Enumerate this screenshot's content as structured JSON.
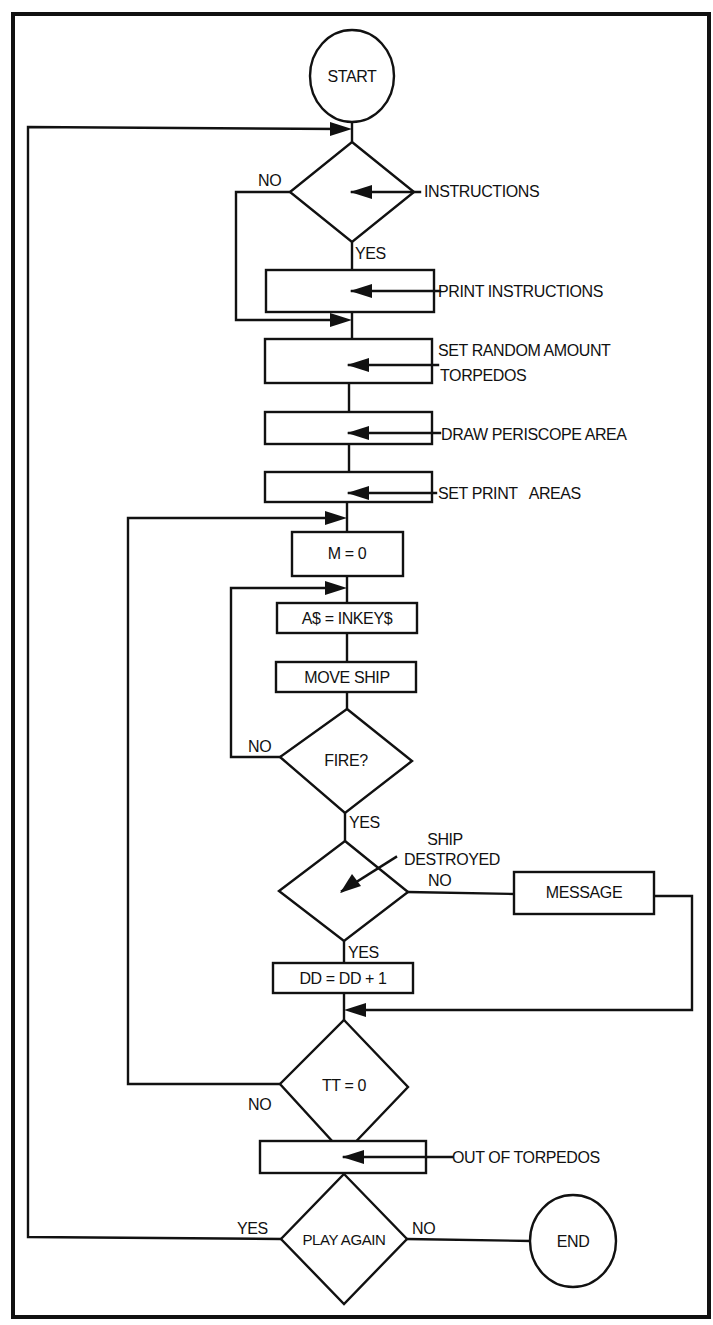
{
  "diagram": {
    "type": "flowchart",
    "colors": {
      "ink": "#111111",
      "paper": "#ffffff"
    }
  },
  "terminals": {
    "start": {
      "label": "START",
      "cx": 352,
      "cy": 76,
      "rx": 42,
      "ry": 46
    },
    "end": {
      "label": "END",
      "cx": 573,
      "cy": 1241,
      "rx": 43,
      "ry": 46
    }
  },
  "decisions": {
    "instructions": {
      "label": "",
      "cx": 352,
      "cy": 192,
      "hw": 62,
      "hh": 50,
      "annotation": "INSTRUCTIONS",
      "no_label": "NO",
      "yes_label": "YES"
    },
    "fire": {
      "label": "FIRE?",
      "cx": 345,
      "cy": 761,
      "hw": 65,
      "hh": 52,
      "no_label": "NO",
      "yes_label": "YES"
    },
    "ship_destroyed": {
      "label": "",
      "cx": 344,
      "cy": 891,
      "hw": 64,
      "hh": 50,
      "annotation_line1": "SHIP",
      "annotation_line2": "DESTROYED",
      "no_label": "NO",
      "yes_label": "YES"
    },
    "tt_zero": {
      "label": "TT = 0",
      "cx": 344,
      "cy": 1087,
      "hw": 64,
      "hh": 67,
      "no_label": "NO",
      "yes_label": "YES"
    },
    "play_again": {
      "label": "PLAY AGAIN",
      "cx": 344,
      "cy": 1239,
      "hw": 63,
      "hh": 65,
      "yes_label": "YES",
      "no_label": "NO"
    }
  },
  "processes": {
    "print_instructions": {
      "label": "",
      "x": 266,
      "y": 270,
      "w": 168,
      "h": 42,
      "annotation": "PRINT INSTRUCTIONS"
    },
    "set_torpedos": {
      "label": "",
      "x": 265,
      "y": 339,
      "w": 167,
      "h": 44,
      "annotation_line1": "SET RANDOM AMOUNT",
      "annotation_line2": "TORPEDOS"
    },
    "draw_periscope": {
      "label": "",
      "x": 265,
      "y": 412,
      "w": 167,
      "h": 32,
      "annotation": "DRAW PERISCOPE AREA"
    },
    "set_print_areas": {
      "label": "",
      "x": 265,
      "y": 472,
      "w": 167,
      "h": 30,
      "annotation": "SET PRINT   AREAS"
    },
    "m_zero": {
      "label": "M = 0",
      "x": 292,
      "y": 532,
      "w": 111,
      "h": 44
    },
    "inkey": {
      "label": "A$ = INKEY$",
      "x": 277,
      "y": 603,
      "w": 140,
      "h": 30
    },
    "move_ship": {
      "label": "MOVE SHIP",
      "x": 276,
      "y": 662,
      "w": 140,
      "h": 30
    },
    "message": {
      "label": "MESSAGE",
      "x": 514,
      "y": 872,
      "w": 140,
      "h": 42
    },
    "dd_inc": {
      "label": "DD = DD + 1",
      "x": 273,
      "y": 963,
      "w": 140,
      "h": 30
    },
    "out_of_torpedos": {
      "label": "",
      "x": 260,
      "y": 1141,
      "w": 166,
      "h": 32,
      "annotation": "OUT OF TORPEDOS"
    }
  }
}
